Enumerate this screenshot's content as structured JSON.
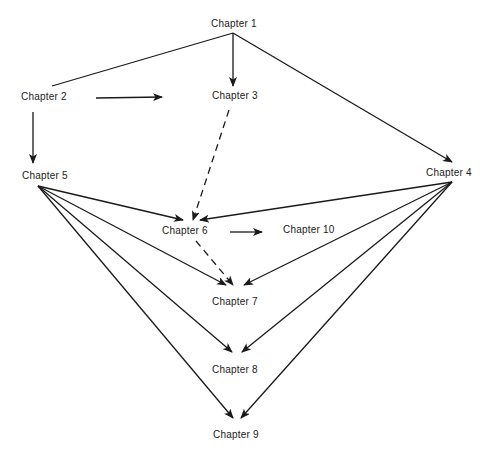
{
  "diagram": {
    "type": "dependency-graph",
    "nodes": [
      {
        "id": "ch1",
        "label": "Chapter 1",
        "x": 211,
        "y": 18
      },
      {
        "id": "ch2",
        "label": "Chapter 2",
        "x": 21,
        "y": 91
      },
      {
        "id": "ch3",
        "label": "Chapter 3",
        "x": 212,
        "y": 90
      },
      {
        "id": "ch4",
        "label": "Chapter 4",
        "x": 426,
        "y": 167
      },
      {
        "id": "ch5",
        "label": "Chapter 5",
        "x": 22,
        "y": 170
      },
      {
        "id": "ch6",
        "label": "Chapter 6",
        "x": 162,
        "y": 225
      },
      {
        "id": "ch10",
        "label": "Chapter 10",
        "x": 283,
        "y": 224
      },
      {
        "id": "ch7",
        "label": "Chapter 7",
        "x": 212,
        "y": 296
      },
      {
        "id": "ch8",
        "label": "Chapter 8",
        "x": 212,
        "y": 364
      },
      {
        "id": "ch9",
        "label": "Chapter 9",
        "x": 213,
        "y": 429
      }
    ],
    "edges": [
      {
        "from": "ch1",
        "to": "ch2",
        "style": "solid",
        "arrow": false,
        "x1": 233,
        "y1": 33,
        "x2": 52,
        "y2": 86
      },
      {
        "from": "ch1",
        "to": "ch3",
        "style": "solid",
        "arrow": true,
        "x1": 233,
        "y1": 33,
        "x2": 233,
        "y2": 86
      },
      {
        "from": "ch1",
        "to": "ch4",
        "style": "solid",
        "arrow": true,
        "x1": 233,
        "y1": 33,
        "x2": 452,
        "y2": 162
      },
      {
        "from": "ch2",
        "to": "ch3",
        "style": "solid",
        "arrow": true,
        "x1": 96,
        "y1": 98,
        "x2": 162,
        "y2": 97
      },
      {
        "from": "ch2",
        "to": "ch5",
        "style": "solid",
        "arrow": true,
        "x1": 33,
        "y1": 112,
        "x2": 33,
        "y2": 163
      },
      {
        "from": "ch3",
        "to": "ch6",
        "style": "dashed",
        "arrow": true,
        "x1": 229,
        "y1": 110,
        "x2": 193,
        "y2": 220
      },
      {
        "from": "ch5",
        "to": "ch6",
        "style": "solid",
        "arrow": true,
        "x1": 38,
        "y1": 186,
        "x2": 183,
        "y2": 220
      },
      {
        "from": "ch4",
        "to": "ch6",
        "style": "solid",
        "arrow": true,
        "x1": 452,
        "y1": 182,
        "x2": 200,
        "y2": 220
      },
      {
        "from": "ch6",
        "to": "ch10",
        "style": "solid",
        "arrow": true,
        "x1": 230,
        "y1": 232,
        "x2": 262,
        "y2": 232
      },
      {
        "from": "ch6",
        "to": "ch7",
        "style": "dashed",
        "arrow": true,
        "x1": 196,
        "y1": 241,
        "x2": 233,
        "y2": 285
      },
      {
        "from": "ch5",
        "to": "ch7",
        "style": "solid",
        "arrow": true,
        "x1": 38,
        "y1": 186,
        "x2": 226,
        "y2": 285
      },
      {
        "from": "ch4",
        "to": "ch7",
        "style": "solid",
        "arrow": true,
        "x1": 452,
        "y1": 182,
        "x2": 244,
        "y2": 285
      },
      {
        "from": "ch5",
        "to": "ch8",
        "style": "solid",
        "arrow": true,
        "x1": 38,
        "y1": 186,
        "x2": 232,
        "y2": 352
      },
      {
        "from": "ch4",
        "to": "ch8",
        "style": "solid",
        "arrow": true,
        "x1": 452,
        "y1": 182,
        "x2": 242,
        "y2": 352
      },
      {
        "from": "ch5",
        "to": "ch9",
        "style": "solid",
        "arrow": true,
        "x1": 38,
        "y1": 186,
        "x2": 233,
        "y2": 418
      },
      {
        "from": "ch4",
        "to": "ch9",
        "style": "solid",
        "arrow": true,
        "x1": 452,
        "y1": 182,
        "x2": 241,
        "y2": 418
      }
    ],
    "colors": {
      "line": "#1a1a1a",
      "text": "#1a1a1a",
      "background": "#ffffff"
    }
  }
}
